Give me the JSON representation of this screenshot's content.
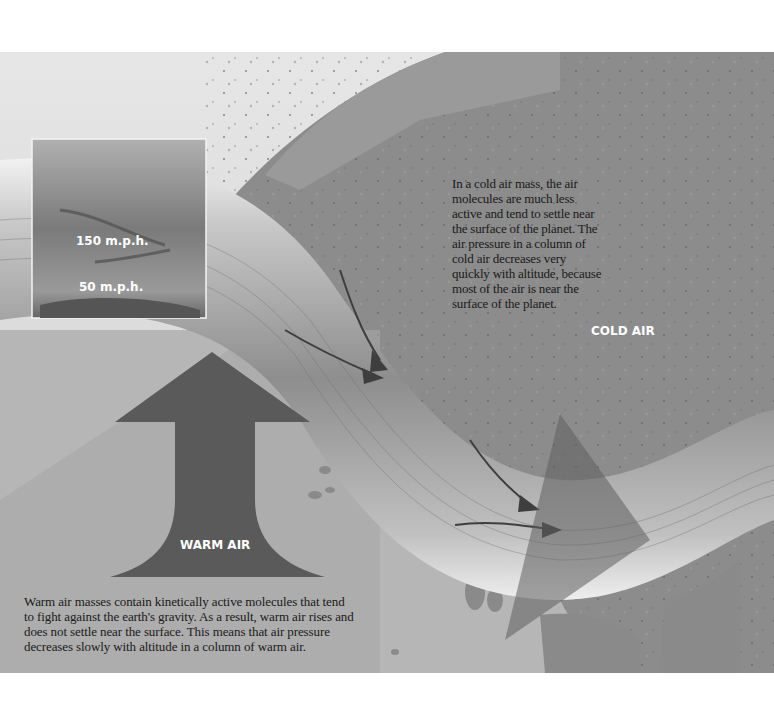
{
  "diagram": {
    "labels": {
      "jet_speed_high": "150 m.p.h.",
      "jet_speed_low": "50 m.p.h.",
      "cold_air": "COLD AIR",
      "warm_air": "WARM AIR"
    },
    "captions": {
      "cold_air": "In a cold air mass, the air molecules are much less active and tend to settle near the surface of the planet. The air pressure in a column of cold air decreases very quickly with altitude, because most of the air is near the surface of the planet.",
      "warm_air": "Warm air masses contain kinetically active molecules that tend to fight against the earth's gravity. As a result, warm air rises and does not settle near the surface. This means that air pressure decreases slowly with altitude in a column of warm air."
    },
    "colors": {
      "sky_light": "#dcdcdc",
      "cold_region": "#8c8c8c",
      "ground_light": "#b4b4b4",
      "warm_arrow": "#5a5a5a",
      "jet_band": "#9a9a9a",
      "text": "#1a1a1a"
    }
  }
}
